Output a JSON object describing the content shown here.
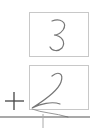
{
  "problem": {
    "top_digit": "3",
    "bottom_digit": "2",
    "operator": "+",
    "answer": ""
  },
  "colors": {
    "box_border": "#c8c8c8",
    "stroke": "#777777",
    "line": "#555555"
  }
}
